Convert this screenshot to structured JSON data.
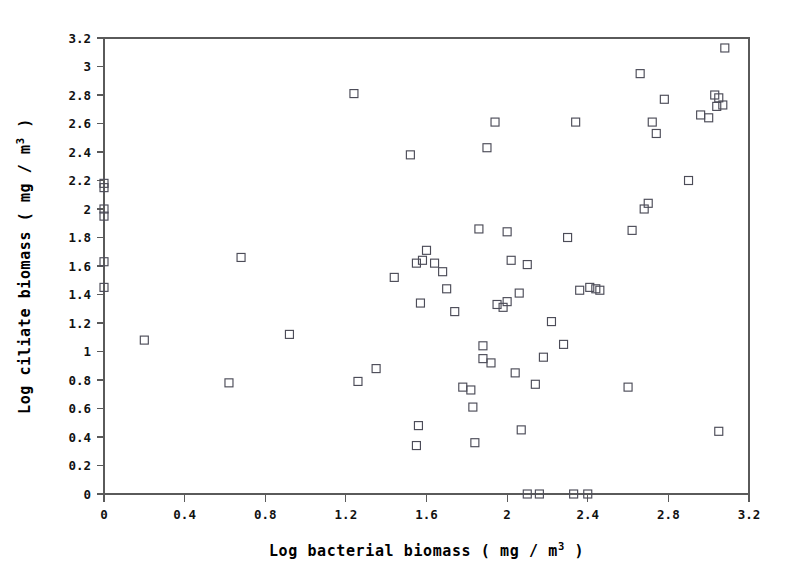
{
  "chart_data": {
    "type": "scatter",
    "title": "",
    "subtitle": "",
    "xlabel": "Log bacterial biomass ( mg / m3 )",
    "xlabel_parts": {
      "pre": "Log bacterial biomass ( mg / m",
      "sup": "3",
      "post": " )"
    },
    "ylabel": "Log ciliate biomass ( mg / m3 )",
    "ylabel_parts": {
      "pre": "Log ciliate biomass ( mg / m",
      "sup": "3",
      "post": " )"
    },
    "xlim": [
      0,
      3.2
    ],
    "ylim": [
      0,
      3.2
    ],
    "xticks": [
      0,
      0.4,
      0.8,
      1.2,
      1.6,
      2,
      2.4,
      2.8,
      3.2
    ],
    "xticklabels": [
      "0",
      "0.4",
      "0.8",
      "1.2",
      "1.6",
      "2",
      "2.4",
      "2.8",
      "3.2"
    ],
    "yticks": [
      0,
      0.2,
      0.4,
      0.6,
      0.8,
      1,
      1.2,
      1.4,
      1.6,
      1.8,
      2,
      2.2,
      2.4,
      2.6,
      2.8,
      3,
      3.2
    ],
    "yticklabels": [
      "0",
      "0.2",
      "0.4",
      "0.6",
      "0.8",
      "1",
      "1.2",
      "1.4",
      "1.6",
      "1.8",
      "2",
      "2.2",
      "2.4",
      "2.6",
      "2.8",
      "3",
      "3.2"
    ],
    "grid": false,
    "legend": null,
    "marker": {
      "shape": "square-open",
      "size": 8,
      "edge_color": "#4c4c58",
      "face_color": "none"
    },
    "axis_color": "#5a5a5a",
    "series": [
      {
        "name": "samples",
        "points": [
          [
            0.0,
            2.18
          ],
          [
            0.0,
            2.15
          ],
          [
            0.0,
            2.0
          ],
          [
            0.0,
            1.95
          ],
          [
            0.0,
            1.63
          ],
          [
            0.0,
            1.45
          ],
          [
            0.2,
            1.08
          ],
          [
            0.62,
            0.78
          ],
          [
            0.68,
            1.66
          ],
          [
            0.92,
            1.12
          ],
          [
            1.24,
            2.81
          ],
          [
            1.26,
            0.79
          ],
          [
            1.35,
            0.88
          ],
          [
            1.44,
            1.52
          ],
          [
            1.52,
            2.38
          ],
          [
            1.55,
            1.62
          ],
          [
            1.58,
            1.64
          ],
          [
            1.6,
            1.71
          ],
          [
            1.57,
            1.34
          ],
          [
            1.64,
            1.62
          ],
          [
            1.68,
            1.56
          ],
          [
            1.7,
            1.44
          ],
          [
            1.56,
            0.48
          ],
          [
            1.55,
            0.34
          ],
          [
            1.74,
            1.28
          ],
          [
            1.78,
            0.75
          ],
          [
            1.82,
            0.73
          ],
          [
            1.83,
            0.61
          ],
          [
            1.84,
            0.36
          ],
          [
            1.86,
            1.86
          ],
          [
            1.9,
            2.43
          ],
          [
            1.88,
            1.04
          ],
          [
            1.88,
            0.95
          ],
          [
            1.92,
            0.92
          ],
          [
            1.94,
            2.61
          ],
          [
            1.95,
            1.33
          ],
          [
            1.98,
            1.31
          ],
          [
            2.0,
            1.35
          ],
          [
            2.0,
            1.84
          ],
          [
            2.02,
            1.64
          ],
          [
            2.04,
            0.85
          ],
          [
            2.06,
            1.41
          ],
          [
            2.1,
            1.61
          ],
          [
            2.07,
            0.45
          ],
          [
            2.1,
            0.0
          ],
          [
            2.16,
            0.0
          ],
          [
            2.14,
            0.77
          ],
          [
            2.18,
            0.96
          ],
          [
            2.22,
            1.21
          ],
          [
            2.33,
            0.0
          ],
          [
            2.4,
            0.0
          ],
          [
            2.28,
            1.05
          ],
          [
            2.3,
            1.8
          ],
          [
            2.34,
            2.61
          ],
          [
            2.36,
            1.43
          ],
          [
            2.41,
            1.45
          ],
          [
            2.44,
            1.44
          ],
          [
            2.46,
            1.43
          ],
          [
            2.6,
            0.75
          ],
          [
            2.62,
            1.85
          ],
          [
            2.66,
            2.95
          ],
          [
            2.68,
            2.0
          ],
          [
            2.7,
            2.04
          ],
          [
            2.72,
            2.61
          ],
          [
            2.74,
            2.53
          ],
          [
            2.78,
            2.77
          ],
          [
            2.9,
            2.2
          ],
          [
            2.96,
            2.66
          ],
          [
            3.0,
            2.64
          ],
          [
            3.03,
            2.8
          ],
          [
            3.05,
            2.78
          ],
          [
            3.04,
            2.72
          ],
          [
            3.07,
            2.73
          ],
          [
            3.08,
            3.13
          ],
          [
            3.05,
            0.44
          ]
        ]
      }
    ]
  }
}
